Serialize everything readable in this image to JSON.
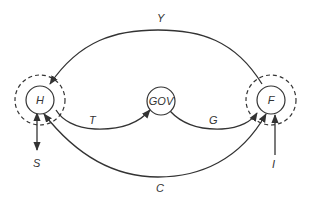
{
  "diagram": {
    "type": "circular-flow",
    "nodes": {
      "household": {
        "label": "H"
      },
      "government": {
        "label": "GOV"
      },
      "firm": {
        "label": "F"
      }
    },
    "flows": {
      "income": {
        "label": "Y",
        "from": "F",
        "to": "H"
      },
      "taxes": {
        "label": "T",
        "from": "H",
        "to": "GOV"
      },
      "gov_spending": {
        "label": "G",
        "from": "GOV",
        "to": "F"
      },
      "consumption": {
        "label": "C",
        "from": "H",
        "to": "F"
      },
      "savings": {
        "label": "S",
        "from": "H",
        "to": "out"
      },
      "investment": {
        "label": "I",
        "from": "in",
        "to": "F"
      }
    },
    "colors": {
      "stroke": "#333333",
      "background": "#ffffff"
    }
  }
}
